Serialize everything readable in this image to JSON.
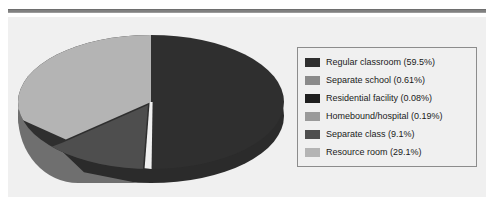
{
  "chart_data": {
    "type": "pie",
    "title": "",
    "subtitle": "",
    "xlabel": "",
    "ylabel": "",
    "three_d": true,
    "exploded_slices": [
      "Separate class"
    ],
    "legend_position": "right",
    "grid": false,
    "categories": [
      "Regular classroom",
      "Separate school",
      "Residential facility",
      "Homebound/hospital",
      "Separate class",
      "Resource room"
    ],
    "values": [
      59.5,
      0.61,
      0.08,
      0.19,
      9.1,
      29.1
    ],
    "value_unit": "%",
    "colors": [
      "#2f2f2f",
      "#8a8a8a",
      "#1f1f1f",
      "#9a9a9a",
      "#4e4e4e",
      "#b4b4b4"
    ],
    "slices": [
      {
        "label": "Regular classroom",
        "value": 59.5,
        "color": "#2f2f2f",
        "legend_text": "Regular classroom (59.5%)"
      },
      {
        "label": "Separate school",
        "value": 0.61,
        "color": "#8a8a8a",
        "legend_text": "Separate school (0.61%)"
      },
      {
        "label": "Residential facility",
        "value": 0.08,
        "color": "#1f1f1f",
        "legend_text": "Residential facility (0.08%)"
      },
      {
        "label": "Homebound/hospital",
        "value": 0.19,
        "color": "#9a9a9a",
        "legend_text": "Homebound/hospital (0.19%)"
      },
      {
        "label": "Separate class",
        "value": 9.1,
        "color": "#4e4e4e",
        "legend_text": "Separate class (9.1%)"
      },
      {
        "label": "Resource room",
        "value": 29.1,
        "color": "#b4b4b4",
        "legend_text": "Resource room (29.1%)"
      }
    ]
  },
  "legend": {
    "items": [
      {
        "text": "Regular classroom (59.5%)",
        "swatch": "#2f2f2f"
      },
      {
        "text": "Separate school (0.61%)",
        "swatch": "#8a8a8a"
      },
      {
        "text": "Residential facility (0.08%)",
        "swatch": "#1f1f1f"
      },
      {
        "text": "Homebound/hospital (0.19%)",
        "swatch": "#9a9a9a"
      },
      {
        "text": "Separate class (9.1%)",
        "swatch": "#4e4e4e"
      },
      {
        "text": "Resource room (29.1%)",
        "swatch": "#b4b4b4"
      }
    ]
  },
  "theme": {
    "panel_background": "#f0f0f0",
    "rule_color": "#808080",
    "legend_border": "#8c8c8c",
    "text_color": "#1a1a1a"
  }
}
